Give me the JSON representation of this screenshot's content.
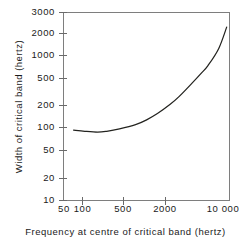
{
  "figure": {
    "background_color": "#ffffff",
    "frame_color": "#7e7e7e",
    "curve_color": "#23231f"
  },
  "chart_data": {
    "type": "line",
    "title": "",
    "xlabel": "Frequency at centre of critical band (hertz)",
    "ylabel": "Width of critical band (hertz)",
    "xscale": "log",
    "yscale": "log",
    "xlim": [
      50,
      10000
    ],
    "ylim": [
      10,
      3000
    ],
    "grid": false,
    "legend": null,
    "xticks": [
      50,
      100,
      500,
      2000,
      10000
    ],
    "xtick_labels": [
      "50",
      "100",
      "500",
      "2000",
      "10 000"
    ],
    "yticks": [
      10,
      20,
      50,
      100,
      200,
      500,
      1000,
      2000,
      3000
    ],
    "ytick_labels": [
      "10",
      "20",
      "50",
      "100",
      "200",
      "500",
      "1000",
      "2000",
      "3000"
    ],
    "series": [
      {
        "name": "critical bandwidth",
        "x": [
          70,
          100,
          150,
          200,
          300,
          500,
          700,
          1000,
          1500,
          2000,
          3000,
          4000,
          5000,
          7000,
          9000
        ],
        "y": [
          85,
          82,
          80,
          82,
          88,
          100,
          115,
          140,
          185,
          235,
          350,
          470,
          600,
          1000,
          1900
        ]
      }
    ]
  }
}
